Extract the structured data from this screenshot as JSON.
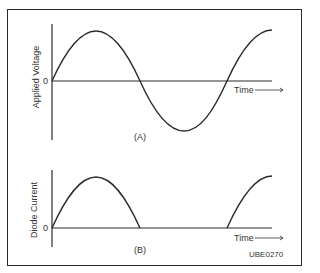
{
  "figure_id": "UBE0270",
  "panels": [
    {
      "id": "A",
      "label": "(A)",
      "ylabel": "Applied Voltage",
      "zero_label": "0",
      "xlabel": "Time",
      "curve": "full sine wave (1.25 cycles)"
    },
    {
      "id": "B",
      "label": "(B)",
      "ylabel": "Diode Current",
      "zero_label": "0",
      "xlabel": "Time",
      "curve": "half-wave rectified (positive half-cycles only)"
    }
  ],
  "colors": {
    "line": "#2a2a2a",
    "text": "#333333",
    "background": "#ffffff"
  }
}
